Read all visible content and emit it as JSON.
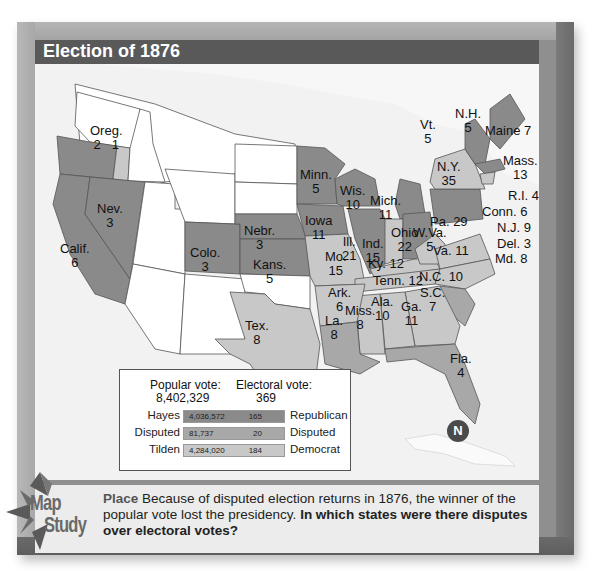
{
  "title": "Election of 1876",
  "colors": {
    "republican": "#8a8a8a",
    "democrat": "#c8c8c8",
    "disputed": "#a8a8a8",
    "territory": "#ffffff",
    "frame": "#8f8f8f",
    "title_bar": "#595959"
  },
  "states": [
    {
      "name": "Oreg.",
      "votes": "2",
      "extra": "1",
      "party": "republican"
    },
    {
      "name": "Calif.",
      "votes": "6",
      "party": "republican"
    },
    {
      "name": "Nev.",
      "votes": "3",
      "party": "republican"
    },
    {
      "name": "Colo.",
      "votes": "3",
      "party": "republican"
    },
    {
      "name": "Nebr.",
      "votes": "3",
      "party": "republican"
    },
    {
      "name": "Kans.",
      "votes": "5",
      "party": "republican"
    },
    {
      "name": "Minn.",
      "votes": "5",
      "party": "republican"
    },
    {
      "name": "Iowa",
      "votes": "11",
      "party": "republican"
    },
    {
      "name": "Wis.",
      "votes": "10",
      "party": "republican"
    },
    {
      "name": "Mich.",
      "votes": "11",
      "party": "republican"
    },
    {
      "name": "Ill.",
      "votes": "21",
      "party": "republican"
    },
    {
      "name": "Ind.",
      "votes": "15",
      "party": "democrat"
    },
    {
      "name": "Ohio",
      "votes": "22",
      "party": "republican"
    },
    {
      "name": "Pa.",
      "votes": "29",
      "party": "republican"
    },
    {
      "name": "N.Y.",
      "votes": "35",
      "party": "democrat"
    },
    {
      "name": "Vt.",
      "votes": "5",
      "party": "republican"
    },
    {
      "name": "N.H.",
      "votes": "5",
      "party": "republican"
    },
    {
      "name": "Maine",
      "votes": "7",
      "party": "republican"
    },
    {
      "name": "Mass.",
      "votes": "13",
      "party": "republican"
    },
    {
      "name": "R.I.",
      "votes": "4",
      "party": "republican"
    },
    {
      "name": "Conn.",
      "votes": "6",
      "party": "democrat"
    },
    {
      "name": "N.J.",
      "votes": "9",
      "party": "democrat"
    },
    {
      "name": "Del.",
      "votes": "3",
      "party": "democrat"
    },
    {
      "name": "Md.",
      "votes": "8",
      "party": "democrat"
    },
    {
      "name": "W.Va.",
      "votes": "5",
      "party": "democrat"
    },
    {
      "name": "Va.",
      "votes": "11",
      "party": "democrat"
    },
    {
      "name": "Ky.",
      "votes": "12",
      "party": "democrat"
    },
    {
      "name": "Tenn.",
      "votes": "12",
      "party": "democrat"
    },
    {
      "name": "N.C.",
      "votes": "10",
      "party": "democrat"
    },
    {
      "name": "S.C.",
      "votes": "7",
      "party": "disputed"
    },
    {
      "name": "Ga.",
      "votes": "11",
      "party": "democrat"
    },
    {
      "name": "Ala.",
      "votes": "10",
      "party": "democrat"
    },
    {
      "name": "Miss.",
      "votes": "8",
      "party": "democrat"
    },
    {
      "name": "La.",
      "votes": "8",
      "party": "disputed"
    },
    {
      "name": "Fla.",
      "votes": "4",
      "party": "disputed"
    },
    {
      "name": "Ark.",
      "votes": "6",
      "party": "democrat"
    },
    {
      "name": "Mo.",
      "votes": "15",
      "party": "democrat"
    },
    {
      "name": "Tex.",
      "votes": "8",
      "party": "democrat"
    }
  ],
  "legend": {
    "popular_header": "Popular vote:",
    "popular_total": "8,402,329",
    "electoral_header": "Electoral vote:",
    "electoral_total": "369",
    "rows": [
      {
        "candidate": "Hayes",
        "popular": "4,036,572",
        "electoral": "165",
        "party": "Republican"
      },
      {
        "candidate": "Disputed",
        "popular": "81,737",
        "electoral": "20",
        "party": "Disputed"
      },
      {
        "candidate": "Tilden",
        "popular": "4,284,020",
        "electoral": "184",
        "party": "Democrat"
      }
    ]
  },
  "compass": {
    "label": "N"
  },
  "badge": {
    "line1": "Map",
    "line2": "Study"
  },
  "caption": {
    "theme": "Place",
    "text": " Because of disputed election returns in 1876, the winner of the popular vote lost the presidency. ",
    "question": "In which states were there disputes over electoral votes?"
  }
}
